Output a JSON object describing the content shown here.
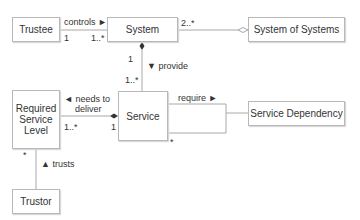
{
  "diagram": {
    "type": "uml-class-diagram",
    "classes": {
      "trustee": "Trustee",
      "system": "System",
      "system_of_systems": "System of Systems",
      "required_service_level": "Required\nService\nLevel",
      "service": "Service",
      "service_dependency": "Service Dependency",
      "trustor": "Trustor"
    },
    "associations": {
      "controls": {
        "label": "controls ►",
        "source_mult": "1",
        "target_mult": "1..*"
      },
      "system_sos": {
        "source_mult": "2..*",
        "kind": "aggregation"
      },
      "provide": {
        "label": "▼ provide",
        "source_mult": "1",
        "target_mult": "1..*",
        "kind": "composition"
      },
      "needs_to_deliver": {
        "label_line1": "◄ needs to",
        "label_line2": "deliver",
        "source_mult": "1..*",
        "target_mult": "1",
        "kind": "composition"
      },
      "require": {
        "label": "require ►",
        "source_mult": "*"
      },
      "trusts": {
        "label": "▲ trusts",
        "source_mult": "*"
      }
    },
    "colors": {
      "line": "#a8a8a8",
      "border": "#b8b8b8",
      "text": "#333333",
      "diamond": "#333333"
    }
  }
}
